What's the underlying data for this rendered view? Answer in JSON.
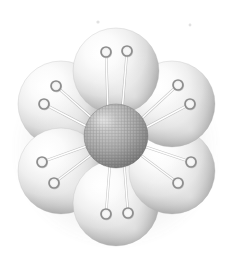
{
  "figure": {
    "title": "Sphere Rosette",
    "background_color": "#ffffff",
    "width": 232,
    "height": 269
  },
  "palette": {
    "background": "#ffffff",
    "petal_highlight": "#ffffff",
    "petal_midtone": "#e2e2e2",
    "petal_shadow": "#8e8e8e",
    "petal_deep_shadow": "#6f6f6f",
    "petal_outline": "#b9b9b9",
    "core_highlight": "#c9c9c9",
    "core_midtone": "#9a9a9a",
    "core_shadow": "#6a6a6a",
    "core_mesh_line": "#6d6d6d",
    "stem_light": "#ffffff",
    "stem_shadow": "#9a9a9a",
    "ring_stroke": "#8d8d8d",
    "ring_fill": "#ededed",
    "speck": "#dcdcdc"
  },
  "core": {
    "label": "central-textured-sphere",
    "cx": 116,
    "cy": 136,
    "r": 32,
    "texture": "mesh-grid",
    "mesh_spacing": 3.1
  },
  "petals": [
    {
      "id": "petal-top",
      "label": "Top petal",
      "cx": 116,
      "cy": 71,
      "r": 43,
      "angle_deg": 270,
      "z": 6
    },
    {
      "id": "petal-upper-right",
      "label": "Upper right petal",
      "cx": 172,
      "cy": 104,
      "r": 43,
      "angle_deg": 330,
      "z": 5
    },
    {
      "id": "petal-lower-right",
      "label": "Lower right petal",
      "cx": 172,
      "cy": 171,
      "r": 43,
      "angle_deg": 30,
      "z": 4
    },
    {
      "id": "petal-bottom",
      "label": "Bottom petal",
      "cx": 116,
      "cy": 203,
      "r": 43,
      "angle_deg": 90,
      "z": 3
    },
    {
      "id": "petal-lower-left",
      "label": "Lower left petal",
      "cx": 61,
      "cy": 171,
      "r": 43,
      "angle_deg": 150,
      "z": 2
    },
    {
      "id": "petal-upper-left",
      "label": "Upper left petal",
      "cx": 61,
      "cy": 104,
      "r": 43,
      "angle_deg": 210,
      "z": 1
    }
  ],
  "pins": [
    {
      "id": "pin-1",
      "petal": "petal-top",
      "x1": 108,
      "y1": 113,
      "x2": 106,
      "y2": 52,
      "ring_r": 5.0
    },
    {
      "id": "pin-2",
      "petal": "petal-top",
      "x1": 122,
      "y1": 112,
      "x2": 127,
      "y2": 51,
      "ring_r": 5.0
    },
    {
      "id": "pin-3",
      "petal": "petal-upper-right",
      "x1": 141,
      "y1": 119,
      "x2": 178,
      "y2": 85,
      "ring_r": 5.0
    },
    {
      "id": "pin-4",
      "petal": "petal-upper-right",
      "x1": 145,
      "y1": 128,
      "x2": 190,
      "y2": 104,
      "ring_r": 5.0
    },
    {
      "id": "pin-5",
      "petal": "petal-lower-right",
      "x1": 146,
      "y1": 147,
      "x2": 191,
      "y2": 162,
      "ring_r": 5.0
    },
    {
      "id": "pin-6",
      "petal": "petal-lower-right",
      "x1": 142,
      "y1": 156,
      "x2": 178,
      "y2": 183,
      "ring_r": 5.0
    },
    {
      "id": "pin-7",
      "petal": "petal-bottom",
      "x1": 124,
      "y1": 162,
      "x2": 128,
      "y2": 213,
      "ring_r": 5.0
    },
    {
      "id": "pin-8",
      "petal": "petal-bottom",
      "x1": 110,
      "y1": 163,
      "x2": 106,
      "y2": 214,
      "ring_r": 5.0
    },
    {
      "id": "pin-9",
      "petal": "petal-lower-left",
      "x1": 91,
      "y1": 155,
      "x2": 54,
      "y2": 183,
      "ring_r": 5.0
    },
    {
      "id": "pin-10",
      "petal": "petal-lower-left",
      "x1": 87,
      "y1": 146,
      "x2": 42,
      "y2": 162,
      "ring_r": 5.0
    },
    {
      "id": "pin-11",
      "petal": "petal-upper-left",
      "x1": 88,
      "y1": 127,
      "x2": 44,
      "y2": 104,
      "ring_r": 5.0
    },
    {
      "id": "pin-12",
      "petal": "petal-upper-left",
      "x1": 92,
      "y1": 118,
      "x2": 56,
      "y2": 86,
      "ring_r": 5.0
    }
  ],
  "specks": [
    {
      "id": "speck-left",
      "cx": 98,
      "cy": 22,
      "r": 1.6
    },
    {
      "id": "speck-right",
      "cx": 190,
      "cy": 25,
      "r": 1.4
    }
  ]
}
